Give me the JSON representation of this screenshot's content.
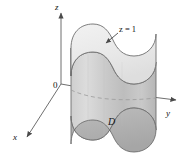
{
  "figure": {
    "background_color": "#ffffff",
    "width": 193,
    "height": 157
  },
  "axes": {
    "origin_label": "0",
    "items": [
      {
        "name": "z",
        "label": "z",
        "direction": "up"
      },
      {
        "name": "y",
        "label": "y",
        "direction": "right"
      },
      {
        "name": "x",
        "label": "x",
        "direction": "down-left"
      }
    ]
  },
  "annotations": {
    "top_plane": {
      "label": "z = 1",
      "variable": "z",
      "relation": "=",
      "value": "1",
      "has_leader_arrow": true
    },
    "base_region": {
      "label": "D"
    }
  },
  "colors": {
    "axis_line": "#6f6f6f",
    "outline": "#5a5a5a",
    "top_face": "#ececec",
    "side_face_light": "#d7d7d7",
    "side_face_mid": "#c6c6c6",
    "side_face_dark": "#b4b4b4",
    "base_region": "#b0b0b0",
    "hidden_dash": "#8a8a8a",
    "text": "#111111"
  }
}
